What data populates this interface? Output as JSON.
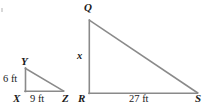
{
  "figure": {
    "kind": "geometry-diagram",
    "background_color": "#ffffff",
    "stroke_color": "#8a8a8a",
    "text_color": "#1a1a1a",
    "stroke_width": 1.6,
    "vertex_labels": [
      {
        "name": "Q",
        "text": "Q"
      },
      {
        "name": "Y",
        "text": "Y"
      },
      {
        "name": "X",
        "text": "X"
      },
      {
        "name": "Z",
        "text": "Z"
      },
      {
        "name": "R",
        "text": "R"
      },
      {
        "name": "S",
        "text": "S"
      }
    ],
    "measure_labels": [
      {
        "name": "QR-side",
        "text": "x"
      },
      {
        "name": "XY-side",
        "text": "6 ft"
      },
      {
        "name": "XZ-base",
        "text": "9 ft"
      },
      {
        "name": "RS-base",
        "text": "27 ft"
      }
    ],
    "small_triangle": {
      "name": "triangle-XYZ",
      "vertices": {
        "Y": [
          25,
          68
        ],
        "X": [
          25,
          91
        ],
        "Z": [
          63,
          91
        ]
      },
      "leg_vertical": "6 ft",
      "leg_horizontal": "9 ft"
    },
    "large_triangle": {
      "name": "triangle-QRS",
      "vertices": {
        "Q": [
          89,
          20
        ],
        "R": [
          89,
          93
        ],
        "S": [
          197,
          93
        ]
      },
      "leg_vertical": "x",
      "leg_horizontal": "27 ft"
    }
  }
}
